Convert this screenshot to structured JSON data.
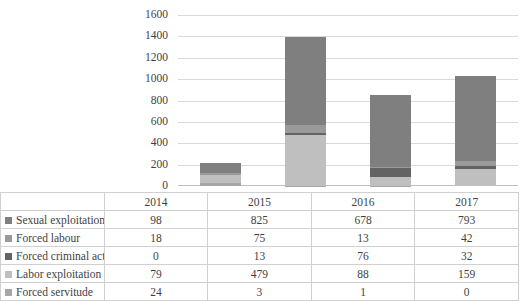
{
  "chart_data": {
    "type": "bar",
    "title": "",
    "xlabel": "",
    "ylabel": "",
    "stacked": true,
    "grid": true,
    "legend_position": "table-row-headers",
    "categories": [
      "2014",
      "2015",
      "2016",
      "2017"
    ],
    "ylim": [
      0,
      1600
    ],
    "yticks": [
      0,
      200,
      400,
      600,
      800,
      1000,
      1200,
      1400,
      1600
    ],
    "series": [
      {
        "name": "Sexual exploitation",
        "values": [
          98,
          825,
          678,
          793
        ],
        "color": "#7f7f7f"
      },
      {
        "name": "Forced labour",
        "values": [
          18,
          75,
          13,
          42
        ],
        "color": "#9a9a9a"
      },
      {
        "name": "Forced criminal activity of minors",
        "values": [
          0,
          13,
          76,
          32
        ],
        "color": "#636363"
      },
      {
        "name": "Labor exploitation",
        "values": [
          79,
          479,
          88,
          159
        ],
        "color": "#bfbfbf"
      },
      {
        "name": "Forced servitude",
        "values": [
          24,
          3,
          1,
          0
        ],
        "color": "#a6a6a6"
      }
    ],
    "totals": [
      219,
      1395,
      856,
      1026
    ]
  },
  "axis": {
    "yticks": [
      "1600",
      "1400",
      "1200",
      "1000",
      "800",
      "600",
      "400",
      "200",
      "0"
    ]
  },
  "table": {
    "corner_label": "",
    "columns": [
      "2014",
      "2015",
      "2016",
      "2017"
    ],
    "rows": [
      {
        "label": "Sexual exploitation",
        "marker": "legend-swatch-sexual-exploitation",
        "color": "#7f7f7f",
        "values": [
          "98",
          "825",
          "678",
          "793"
        ]
      },
      {
        "label": "Forced labour",
        "marker": "legend-swatch-forced-labour",
        "color": "#9a9a9a",
        "values": [
          "18",
          "75",
          "13",
          "42"
        ]
      },
      {
        "label": "Forced criminal activity of minors",
        "marker": "legend-swatch-forced-criminal-activity",
        "color": "#636363",
        "values": [
          "0",
          "13",
          "76",
          "32"
        ]
      },
      {
        "label": "Labor exploitation",
        "marker": "legend-swatch-labor-exploitation",
        "color": "#bfbfbf",
        "values": [
          "79",
          "479",
          "88",
          "159"
        ]
      },
      {
        "label": "Forced servitude",
        "marker": "legend-swatch-forced-servitude",
        "color": "#a6a6a6",
        "values": [
          "24",
          "3",
          "1",
          "0"
        ]
      }
    ]
  }
}
